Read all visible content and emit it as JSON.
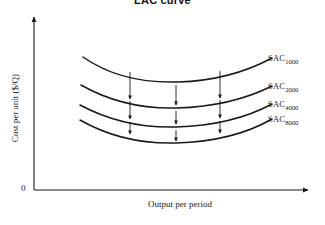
{
  "figure": {
    "title": "LAC curve",
    "background_color": "#ffffff",
    "line_color": "#1a1a1a",
    "width": 325,
    "height": 225
  },
  "axes": {
    "y_label": "Cost per unit ($/Q)",
    "x_label": "Output per period",
    "origin_label": "0"
  },
  "chart_data": {
    "type": "line",
    "title": "LAC curve",
    "xlabel": "Output per period",
    "ylabel": "Cost per unit ($/Q)",
    "grid": false,
    "legend_position": "right-inline",
    "xlim": [
      0,
      325
    ],
    "ylim": [
      0,
      225
    ],
    "annotations": [
      "Downward arrows show successive cost reductions from SAC 1000 to SAC 2000 to SAC 4000 to SAC 8000"
    ],
    "series": [
      {
        "name": "SAC",
        "subscript": "1000",
        "label": "SAC 1000",
        "minimum_y_px": 82,
        "minimum_x_px": 178,
        "path": "M 83,57 C 110,76 142,83 178,82 C 214,81 246,72 272,58"
      },
      {
        "name": "SAC",
        "subscript": "2000",
        "label": "SAC 2000",
        "minimum_y_px": 108,
        "minimum_x_px": 177,
        "path": "M 81,85 C 109,101 142,109 177,108 C 212,107 246,99 272,86"
      },
      {
        "name": "SAC",
        "subscript": "4000",
        "label": "SAC 4000",
        "minimum_y_px": 127,
        "minimum_x_px": 176,
        "path": "M 80,105 C 108,120 141,128 176,127 C 211,126 246,118 272,104"
      },
      {
        "name": "SAC",
        "subscript": "8000",
        "label": "SAC 8000",
        "minimum_y_px": 143,
        "minimum_x_px": 176,
        "path": "M 80,120 C 108,136 141,144 176,143 C 211,142 246,134 272,119"
      }
    ],
    "arrows": [
      {
        "x": 130,
        "y1": 72,
        "y2": 99,
        "group": "1000-to-2000"
      },
      {
        "x": 176,
        "y1": 85,
        "y2": 105,
        "group": "1000-to-2000"
      },
      {
        "x": 220,
        "y1": 71,
        "y2": 98,
        "group": "1000-to-2000"
      },
      {
        "x": 130,
        "y1": 101,
        "y2": 119,
        "group": "2000-to-4000"
      },
      {
        "x": 176,
        "y1": 111,
        "y2": 124,
        "group": "2000-to-4000"
      },
      {
        "x": 220,
        "y1": 100,
        "y2": 118,
        "group": "2000-to-4000"
      },
      {
        "x": 130,
        "y1": 122,
        "y2": 134,
        "group": "4000-to-8000"
      },
      {
        "x": 176,
        "y1": 130,
        "y2": 141,
        "group": "4000-to-8000"
      },
      {
        "x": 220,
        "y1": 121,
        "y2": 133,
        "group": "4000-to-8000"
      }
    ]
  },
  "curve_labels": [
    {
      "text": "SAC",
      "sub": "1000",
      "left": 268,
      "top": 53
    },
    {
      "text": "SAC",
      "sub": "2000",
      "left": 268,
      "top": 81
    },
    {
      "text": "SAC",
      "sub": "4000",
      "left": 268,
      "top": 99
    },
    {
      "text": "SAC",
      "sub": "8000",
      "left": 268,
      "top": 114
    }
  ]
}
